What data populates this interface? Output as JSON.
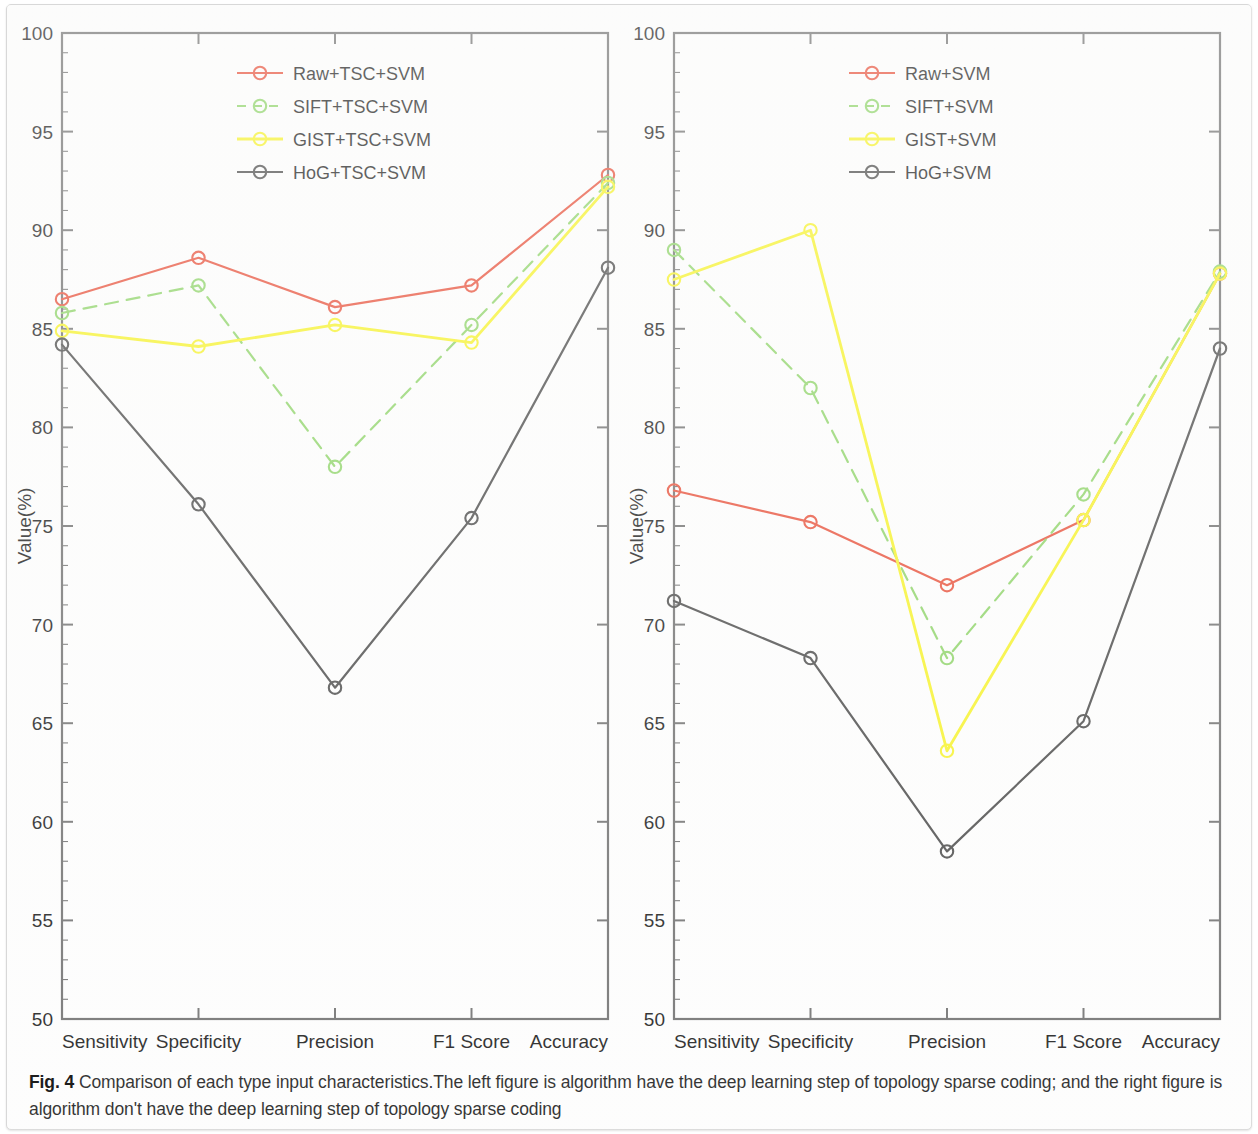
{
  "figure": {
    "label": "Fig. 4",
    "caption": "Comparison of each type input characteristics.The left figure is algorithm have the deep learning step of topology sparse coding; and the right figure is algorithm don't have the deep learning step of topology sparse coding"
  },
  "colors": {
    "raw": "#e8503a",
    "sift": "#8ed468",
    "gist": "#f7f32a",
    "hog": "#4a4a4a",
    "axis": "#6f6f6f",
    "text": "#1a1a1a"
  },
  "chart_data": [
    {
      "type": "line",
      "id": "left-panel",
      "title": "",
      "xlabel": "",
      "ylabel": "Value(%)",
      "categories": [
        "Sensitivity",
        "Specificity",
        "Precision",
        "F1 Score",
        "Accuracy"
      ],
      "ylim": [
        50,
        100
      ],
      "yticks": [
        50,
        55,
        60,
        65,
        70,
        75,
        80,
        85,
        90,
        95,
        100
      ],
      "grid": false,
      "legend_position": "top-center",
      "markers": "circle",
      "series": [
        {
          "name": "Raw+TSC+SVM",
          "color": "#e8503a",
          "style": "solid",
          "values": [
            86.5,
            88.6,
            86.1,
            87.2,
            92.8
          ]
        },
        {
          "name": "SIFT+TSC+SVM",
          "color": "#8ed468",
          "style": "dashed",
          "values": [
            85.8,
            87.2,
            78.0,
            85.2,
            92.4
          ]
        },
        {
          "name": "GIST+TSC+SVM",
          "color": "#f7f32a",
          "style": "solid",
          "values": [
            84.9,
            84.1,
            85.2,
            84.3,
            92.2
          ]
        },
        {
          "name": "HoG+TSC+SVM",
          "color": "#4a4a4a",
          "style": "solid",
          "values": [
            84.2,
            76.1,
            66.8,
            75.4,
            88.1
          ]
        }
      ]
    },
    {
      "type": "line",
      "id": "right-panel",
      "title": "",
      "xlabel": "",
      "ylabel": "Value(%)",
      "categories": [
        "Sensitivity",
        "Specificity",
        "Precision",
        "F1 Score",
        "Accuracy"
      ],
      "ylim": [
        50,
        100
      ],
      "yticks": [
        50,
        55,
        60,
        65,
        70,
        75,
        80,
        85,
        90,
        95,
        100
      ],
      "grid": false,
      "legend_position": "top-center",
      "markers": "circle",
      "series": [
        {
          "name": "Raw+SVM",
          "color": "#e8503a",
          "style": "solid",
          "values": [
            76.8,
            75.2,
            72.0,
            75.3,
            87.8
          ]
        },
        {
          "name": "SIFT+SVM",
          "color": "#8ed468",
          "style": "dashed",
          "values": [
            89.0,
            82.0,
            68.3,
            76.6,
            87.9
          ]
        },
        {
          "name": "GIST+SVM",
          "color": "#f7f32a",
          "style": "solid",
          "values": [
            87.5,
            90.0,
            63.6,
            75.3,
            87.8
          ]
        },
        {
          "name": "HoG+SVM",
          "color": "#4a4a4a",
          "style": "solid",
          "values": [
            71.2,
            68.3,
            58.5,
            65.1,
            84.0
          ]
        }
      ]
    }
  ]
}
